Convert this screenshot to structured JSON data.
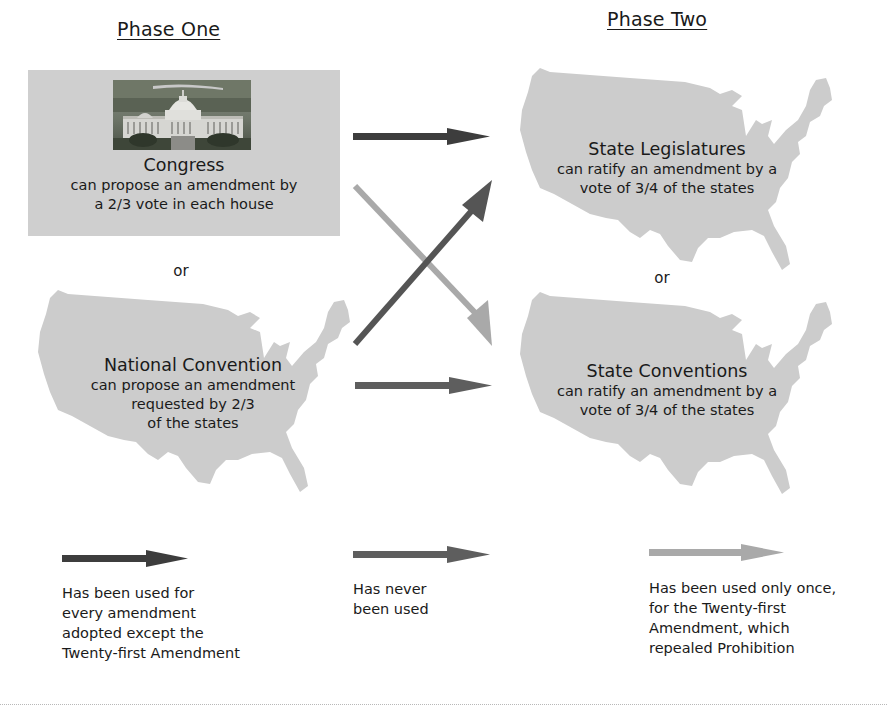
{
  "phases": {
    "one_title": "Phase One",
    "two_title": "Phase Two"
  },
  "phase_one": {
    "congress": {
      "title": "Congress",
      "lines": [
        "can propose an amendment by",
        "a 2/3 vote in each house"
      ],
      "image": "us-capitol-photo"
    },
    "or": "or",
    "convention": {
      "title": "National Convention",
      "lines": [
        "can propose an amendment",
        "requested by 2/3",
        "of the states"
      ]
    }
  },
  "phase_two": {
    "legislatures": {
      "title": "State Legislatures",
      "lines": [
        "can ratify an amendment by a",
        "vote of 3/4 of the states"
      ]
    },
    "or": "or",
    "conventions": {
      "title": "State Conventions",
      "lines": [
        "can ratify an amendment by a",
        "vote of 3/4 of the states"
      ]
    }
  },
  "arrows": {
    "colors": {
      "dark": "#3d3d3d",
      "medium": "#5e5e5e",
      "light": "#a9a9a9"
    },
    "connections": [
      {
        "from": "Congress",
        "to": "State Legislatures",
        "style": "dark"
      },
      {
        "from": "Congress",
        "to": "State Conventions",
        "style": "light"
      },
      {
        "from": "National Convention",
        "to": "State Legislatures",
        "style": "medium"
      },
      {
        "from": "National Convention",
        "to": "State Conventions",
        "style": "medium"
      }
    ]
  },
  "legend": [
    {
      "style": "dark",
      "lines": [
        "Has been used for",
        "every amendment",
        "adopted except the",
        "Twenty-first Amendment"
      ]
    },
    {
      "style": "medium",
      "lines": [
        "Has never",
        "been used"
      ]
    },
    {
      "style": "light",
      "lines": [
        "Has been used only once,",
        "for the Twenty-first",
        "Amendment, which",
        "repealed Prohibition"
      ]
    }
  ],
  "colors": {
    "map_fill": "#cccccc",
    "box_fill": "#cfcfcf",
    "text": "#1a1a1a"
  }
}
